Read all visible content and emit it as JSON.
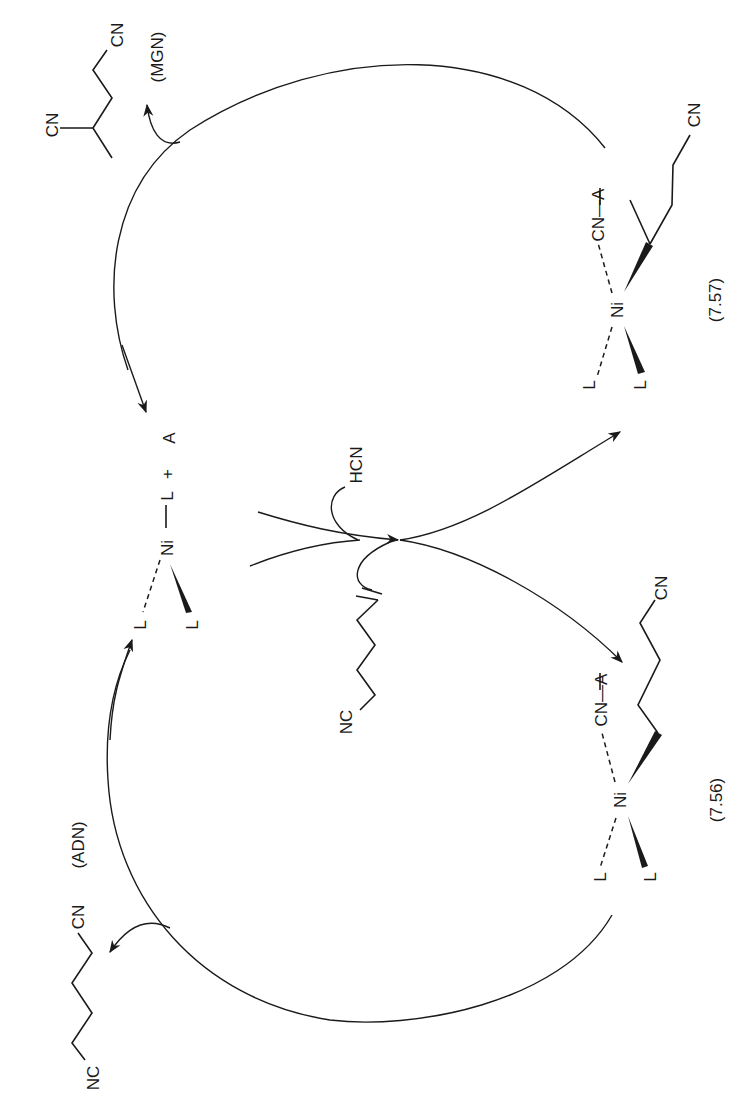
{
  "diagram": {
    "type": "catalytic-cycle",
    "orientation": "rotated-90-ccw",
    "catalyst": {
      "ni": "Ni",
      "l_top": "L",
      "plus": "+",
      "additive": "A",
      "l_dashed": "L",
      "l_wedge": "L"
    },
    "reagents": {
      "hcn": "HCN",
      "alkene_nc": "NC"
    },
    "complex_756": {
      "ni": "Ni",
      "cn_a": "CN—A",
      "chain_cn": "CN",
      "l_dashed": "L",
      "l_wedge": "L",
      "label": "(7.56)"
    },
    "complex_757": {
      "ni": "Ni",
      "cn_a": "CN—A",
      "chain_cn": "CN",
      "l_dashed": "L",
      "l_wedge": "L",
      "label": "(7.57)"
    },
    "product_adn": {
      "nc": "NC",
      "cn": "CN",
      "label": "(ADN)"
    },
    "product_mgn": {
      "cn_branch": "CN",
      "cn_end": "CN",
      "label": "(MGN)"
    }
  }
}
